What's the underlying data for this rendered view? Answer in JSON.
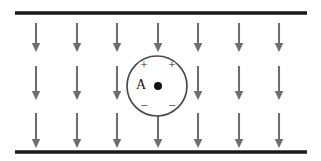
{
  "figure": {
    "background_color": "#ffffff",
    "width": 321,
    "height": 161
  },
  "plates": {
    "color": "#1a1a1a",
    "thickness": 3.4,
    "x_start": 15,
    "x_end": 307,
    "top": {
      "label": "top-plate",
      "y": 13
    },
    "bottom": {
      "label": "bottom-plate",
      "y": 152
    }
  },
  "field": {
    "color": "#6e6e6e",
    "direction": "down",
    "columns_x": [
      36,
      77,
      117,
      158,
      198,
      239,
      279
    ],
    "rows": [
      {
        "y_top": 23,
        "y_bottom": 52
      },
      {
        "y_top": 66,
        "y_bottom": 100
      },
      {
        "y_top": 113,
        "y_bottom": 148
      }
    ],
    "arrow_count": 21,
    "hidden_arrow_note": "middle-row center arrow is covered by the sphere"
  },
  "sphere": {
    "name": "polarized-sphere",
    "center_x": 157,
    "center_y": 86,
    "radius": 30,
    "stroke_color": "#4a4a4a",
    "fill_color": "#ffffff",
    "label": "A",
    "label_x": 141,
    "label_y": 86,
    "center_dot_x": 158,
    "center_dot_y": 86,
    "center_dot_radius": 4,
    "charges": [
      {
        "sign": "+",
        "x": 144,
        "y": 66
      },
      {
        "sign": "+",
        "x": 172,
        "y": 66
      },
      {
        "sign": "−",
        "x": 144,
        "y": 107
      },
      {
        "sign": "−",
        "x": 172,
        "y": 107
      }
    ]
  }
}
